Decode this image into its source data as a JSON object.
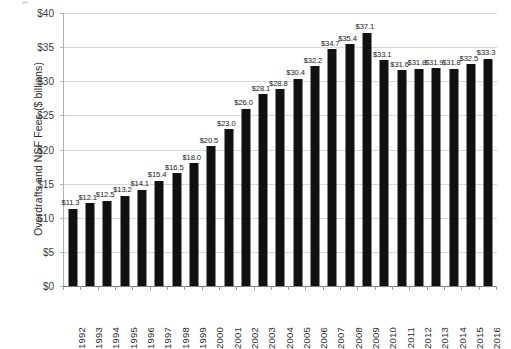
{
  "chart_data": {
    "type": "bar",
    "title": "",
    "subtitle": "",
    "xlabel": "",
    "ylabel": "Overdrafts and NSF Fees ($ billions)",
    "categories": [
      "1992",
      "1993",
      "1994",
      "1995",
      "1996",
      "1997",
      "1998",
      "1999",
      "2000",
      "2001",
      "2002",
      "2003",
      "2004",
      "2005",
      "2006",
      "2007",
      "2008",
      "2009",
      "2010",
      "2011",
      "2012",
      "2013",
      "2014",
      "2015",
      "2016"
    ],
    "values": [
      11.3,
      12.1,
      12.5,
      13.2,
      14.1,
      15.4,
      16.5,
      18.0,
      20.5,
      23.0,
      26.0,
      28.1,
      28.8,
      30.4,
      32.2,
      34.7,
      35.4,
      37.1,
      33.1,
      31.6,
      31.8,
      31.9,
      31.8,
      32.5,
      33.3
    ],
    "point_labels": [
      "$11.3",
      "$12.1",
      "$12.5",
      "$13.2",
      "$14.1",
      "$15.4",
      "$16.5",
      "$18.0",
      "$20.5",
      "$23.0",
      "$26.0",
      "$28.1",
      "$28.8",
      "$30.4",
      "$32.2",
      "$34.7",
      "$35.4",
      "$37.1",
      "$33.1",
      "$31.6",
      "$31.8",
      "$31.9",
      "$31.8",
      "$32.5",
      "$33.3"
    ],
    "ylim": [
      0,
      40
    ],
    "ytick_values": [
      0,
      5,
      10,
      15,
      20,
      25,
      30,
      35,
      40
    ],
    "ytick_labels": [
      "$0",
      "$5",
      "$10",
      "$15",
      "$20",
      "$25",
      "$30",
      "$35",
      "$40"
    ],
    "grid": true,
    "legend": false,
    "legend_position": "none",
    "bar_color": "#111111",
    "gridline_color": "#d9d9d9",
    "axis_color": "#7d7d7d",
    "background_color": "#ffffff"
  }
}
